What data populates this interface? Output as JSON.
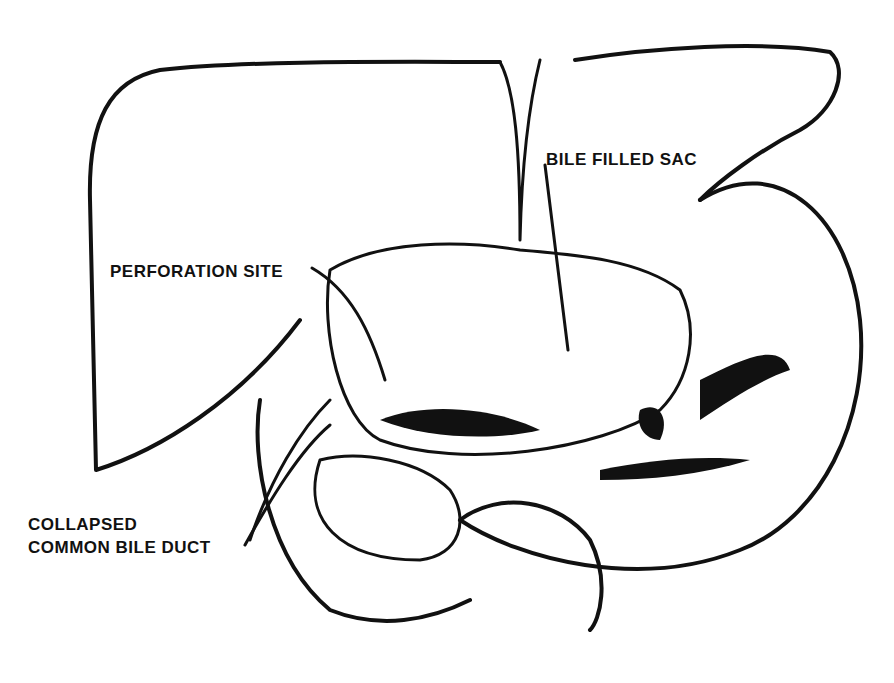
{
  "diagram": {
    "type": "anatomical illustration",
    "labels": {
      "bile_filled_sac": "BILE FILLED SAC",
      "perforation_site": "PERFORATION SITE",
      "collapsed_cbd_line1": "COLLAPSED",
      "collapsed_cbd_line2": "COMMON BILE DUCT"
    },
    "colors": {
      "ink": "#111111",
      "paper": "#ffffff"
    }
  }
}
